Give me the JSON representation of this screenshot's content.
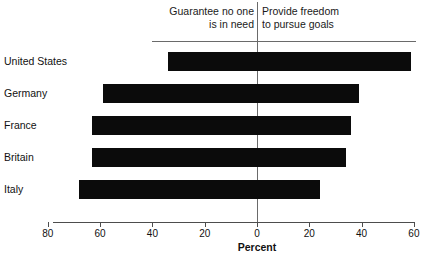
{
  "header": {
    "left_label": "Guarantee no one\nis in need",
    "right_label": "Provide freedom\nto pursue goals"
  },
  "axis": {
    "title": "Percent",
    "tick_labels": [
      "80",
      "60",
      "40",
      "20",
      "0",
      "20",
      "40",
      "60"
    ],
    "tick_values": [
      -80,
      -60,
      -40,
      -20,
      0,
      20,
      40,
      60
    ]
  },
  "chart_data": {
    "type": "bar",
    "orientation": "horizontal",
    "style": "diverging",
    "title": "",
    "subtitle": "",
    "xlabel": "Percent",
    "ylabel": "",
    "xlim": [
      -80,
      60
    ],
    "grid": false,
    "legend_position": "top",
    "categories": [
      "United States",
      "Germany",
      "France",
      "Britain",
      "Italy"
    ],
    "series": [
      {
        "name": "Guarantee no one is in need",
        "values": [
          34,
          59,
          63,
          63,
          68
        ]
      },
      {
        "name": "Provide freedom to pursue goals",
        "values": [
          59,
          39,
          36,
          34,
          24
        ]
      }
    ],
    "bar_color": "#0b0b0b"
  },
  "rows": [
    {
      "label": "United States",
      "left": 34,
      "right": 59
    },
    {
      "label": "Germany",
      "left": 59,
      "right": 39
    },
    {
      "label": "France",
      "left": 63,
      "right": 36
    },
    {
      "label": "Britain",
      "left": 63,
      "right": 34
    },
    {
      "label": "Italy",
      "left": 68,
      "right": 24
    }
  ]
}
